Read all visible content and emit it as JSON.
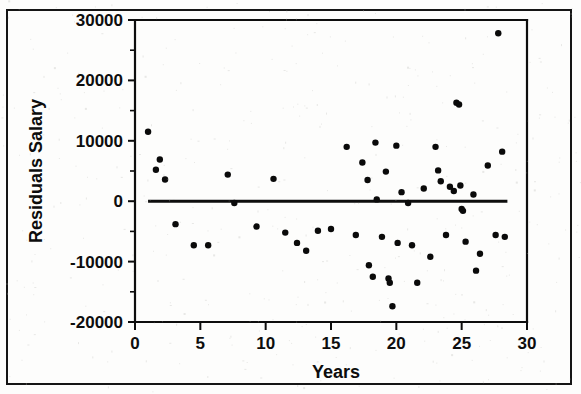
{
  "figure": {
    "partial_title": "",
    "background_color": "#fdfdfc",
    "frame_color": "#151515",
    "marker_color": "#0a0a0a"
  },
  "chart_data": {
    "type": "scatter",
    "title": "",
    "xlabel": "Years",
    "ylabel": "Residuals Salary",
    "xlim": [
      0,
      30
    ],
    "ylim": [
      -20000,
      30000
    ],
    "xticks": [
      0,
      5,
      10,
      15,
      20,
      25,
      30
    ],
    "xtick_labels": [
      "0",
      "5",
      "10",
      "15",
      "20",
      "25",
      "30"
    ],
    "yticks": [
      -20000,
      -10000,
      0,
      10000,
      20000,
      30000
    ],
    "ytick_labels": [
      "-20000",
      "-10000",
      "0",
      "10000",
      "20000",
      "30000"
    ],
    "grid": false,
    "legend": false,
    "reference_line": {
      "orientation": "horizontal",
      "y": 0,
      "x_start": 1.0,
      "x_end": 28.5
    },
    "points": [
      [
        1.0,
        11500
      ],
      [
        1.6,
        5200
      ],
      [
        1.9,
        6900
      ],
      [
        2.3,
        3600
      ],
      [
        3.1,
        -3800
      ],
      [
        4.5,
        -7300
      ],
      [
        5.6,
        -7300
      ],
      [
        7.1,
        4400
      ],
      [
        7.6,
        -300
      ],
      [
        9.3,
        -4200
      ],
      [
        10.6,
        3700
      ],
      [
        11.5,
        -5200
      ],
      [
        12.4,
        -6900
      ],
      [
        13.1,
        -8200
      ],
      [
        14.0,
        -4900
      ],
      [
        15.0,
        -4600
      ],
      [
        16.2,
        9000
      ],
      [
        16.9,
        -5600
      ],
      [
        17.4,
        6400
      ],
      [
        17.8,
        3500
      ],
      [
        17.9,
        -10600
      ],
      [
        18.2,
        -12500
      ],
      [
        18.4,
        9700
      ],
      [
        18.5,
        300
      ],
      [
        18.9,
        -5900
      ],
      [
        19.2,
        4900
      ],
      [
        19.4,
        -12800
      ],
      [
        19.5,
        -13500
      ],
      [
        19.7,
        -17400
      ],
      [
        20.0,
        9200
      ],
      [
        20.1,
        -6900
      ],
      [
        20.4,
        1500
      ],
      [
        20.9,
        -300
      ],
      [
        21.2,
        -7300
      ],
      [
        21.6,
        -13500
      ],
      [
        22.1,
        2100
      ],
      [
        22.6,
        -9200
      ],
      [
        23.0,
        9000
      ],
      [
        23.2,
        5100
      ],
      [
        23.4,
        3300
      ],
      [
        23.8,
        -5600
      ],
      [
        24.1,
        2400
      ],
      [
        24.4,
        1700
      ],
      [
        24.6,
        16300
      ],
      [
        24.8,
        16000
      ],
      [
        24.9,
        2600
      ],
      [
        25.0,
        -1300
      ],
      [
        25.1,
        -1600
      ],
      [
        25.3,
        -6700
      ],
      [
        25.9,
        1100
      ],
      [
        26.1,
        -11500
      ],
      [
        26.4,
        -8700
      ],
      [
        27.0,
        5900
      ],
      [
        27.6,
        -5600
      ],
      [
        27.8,
        27800
      ],
      [
        28.1,
        8200
      ],
      [
        28.3,
        -5900
      ]
    ]
  }
}
